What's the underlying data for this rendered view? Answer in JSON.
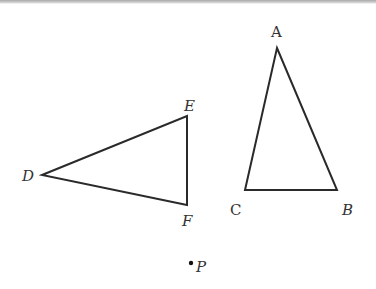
{
  "diagram": {
    "stroke_color": "#2a2a2a",
    "label_color": "#333333",
    "triangles": [
      {
        "name": "ABC",
        "vertices": {
          "A": {
            "x": 277,
            "y": 48,
            "label": "A",
            "label_x": 271,
            "label_y": 37
          },
          "B": {
            "x": 337,
            "y": 190,
            "label": "B",
            "label_x": 342,
            "label_y": 215
          },
          "C": {
            "x": 245,
            "y": 190,
            "label": "C",
            "label_x": 230,
            "label_y": 215
          }
        }
      },
      {
        "name": "DEF",
        "vertices": {
          "D": {
            "x": 42,
            "y": 175,
            "label": "D",
            "label_x": 22,
            "label_y": 181
          },
          "E": {
            "x": 187,
            "y": 116,
            "label": "E",
            "label_x": 184,
            "label_y": 111
          },
          "F": {
            "x": 187,
            "y": 205,
            "label": "F",
            "label_x": 182,
            "label_y": 226
          }
        }
      }
    ],
    "point": {
      "label": "P",
      "x": 191,
      "y": 263,
      "label_x": 196,
      "label_y": 272
    }
  }
}
